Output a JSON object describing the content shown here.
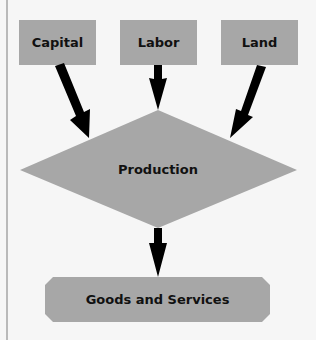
{
  "diagram": {
    "inputs": [
      {
        "label": "Capital"
      },
      {
        "label": "Labor"
      },
      {
        "label": "Land"
      }
    ],
    "process": {
      "label": "Production"
    },
    "output": {
      "label": "Goods and Services"
    },
    "colors": {
      "background": "#f6f6f6",
      "box_fill": "#a7a7a7",
      "arrow": "#000000",
      "text": "#111111",
      "left_rule": "#b9b9b9"
    }
  }
}
